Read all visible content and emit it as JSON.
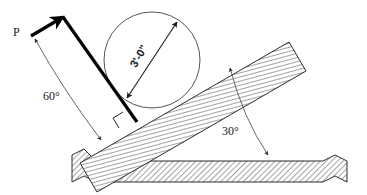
{
  "figure": {
    "background_color": "#ffffff",
    "line_color": "#2b2b2b",
    "hatch_color": "#555555",
    "force_color": "#000000",
    "width": 367,
    "height": 195
  },
  "labels": {
    "force": "P",
    "force_angle": "60°",
    "incline_angle": "30°",
    "dimension": "3'-0\""
  },
  "annotations": [
    {
      "name": "force-vector-label",
      "text": "P",
      "x": 13,
      "y": 36,
      "rotation": 0
    },
    {
      "name": "force-angle-label",
      "text": "60°",
      "x": 43,
      "y": 100,
      "rotation": 0
    },
    {
      "name": "incline-angle-label",
      "text": "30°",
      "x": 222,
      "y": 135,
      "rotation": 0
    },
    {
      "name": "length-dimension-label",
      "text": "3'-0\"",
      "x": 142,
      "y": 58,
      "rotation": -60
    }
  ],
  "geometry": {
    "incline_angle_degrees": 30,
    "force_angle_degrees": 60,
    "member_length_label": "3'-0\"",
    "right_angle_marker": true,
    "break_lines": 2
  }
}
